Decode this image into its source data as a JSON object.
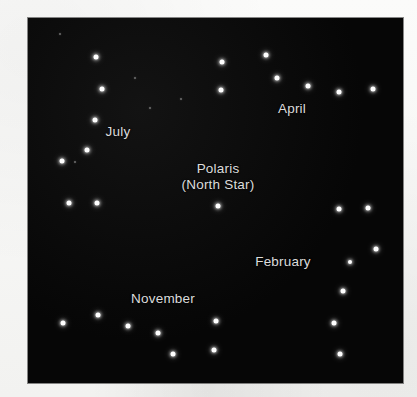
{
  "figure": {
    "kind": "star-chart",
    "background_color": "#f7f7f5",
    "sky_color": "#070707",
    "star_color": "#ffffff",
    "label_color": "#dcdcdc",
    "panel": {
      "x": 28,
      "y": 18,
      "width": 375,
      "height": 365
    }
  },
  "labels": [
    {
      "id": "july",
      "text": "July",
      "x": 118,
      "y": 132
    },
    {
      "id": "april",
      "text": "April",
      "x": 292,
      "y": 109
    },
    {
      "id": "february",
      "text": "February",
      "x": 283,
      "y": 262
    },
    {
      "id": "november",
      "text": "November",
      "x": 163,
      "y": 299
    }
  ],
  "polaris": {
    "line1": "Polaris",
    "line2": "(North Star)",
    "x": 218,
    "y": 177,
    "star": {
      "x": 218,
      "y": 206,
      "size": 5
    }
  },
  "stars": [
    {
      "group": "july",
      "x": 96,
      "y": 57,
      "size": 5
    },
    {
      "group": "july",
      "x": 102,
      "y": 89,
      "size": 5
    },
    {
      "group": "july",
      "x": 95,
      "y": 120,
      "size": 5
    },
    {
      "group": "july",
      "x": 87,
      "y": 150,
      "size": 5
    },
    {
      "group": "july",
      "x": 62,
      "y": 161,
      "size": 5
    },
    {
      "group": "july",
      "x": 69,
      "y": 203,
      "size": 5
    },
    {
      "group": "july",
      "x": 97,
      "y": 203,
      "size": 5
    },
    {
      "group": "april",
      "x": 222,
      "y": 62,
      "size": 5
    },
    {
      "group": "april",
      "x": 266,
      "y": 55,
      "size": 5
    },
    {
      "group": "april",
      "x": 277,
      "y": 78,
      "size": 5
    },
    {
      "group": "april",
      "x": 221,
      "y": 90,
      "size": 5
    },
    {
      "group": "april",
      "x": 308,
      "y": 86,
      "size": 5
    },
    {
      "group": "april",
      "x": 339,
      "y": 92,
      "size": 5
    },
    {
      "group": "april",
      "x": 373,
      "y": 89,
      "size": 5
    },
    {
      "group": "february",
      "x": 339,
      "y": 209,
      "size": 5
    },
    {
      "group": "february",
      "x": 368,
      "y": 208,
      "size": 5
    },
    {
      "group": "february",
      "x": 376,
      "y": 249,
      "size": 5
    },
    {
      "group": "february",
      "x": 350,
      "y": 262,
      "size": 4
    },
    {
      "group": "february",
      "x": 343,
      "y": 291,
      "size": 5
    },
    {
      "group": "february",
      "x": 334,
      "y": 323,
      "size": 5
    },
    {
      "group": "february",
      "x": 340,
      "y": 354,
      "size": 5
    },
    {
      "group": "november",
      "x": 63,
      "y": 323,
      "size": 5
    },
    {
      "group": "november",
      "x": 98,
      "y": 315,
      "size": 5
    },
    {
      "group": "november",
      "x": 128,
      "y": 326,
      "size": 5
    },
    {
      "group": "november",
      "x": 158,
      "y": 333,
      "size": 5
    },
    {
      "group": "november",
      "x": 173,
      "y": 354,
      "size": 5
    },
    {
      "group": "november",
      "x": 216,
      "y": 321,
      "size": 5
    },
    {
      "group": "november",
      "x": 214,
      "y": 350,
      "size": 5
    }
  ],
  "faint_stars": [
    {
      "x": 60,
      "y": 34,
      "size": 2
    },
    {
      "x": 135,
      "y": 78,
      "size": 2
    },
    {
      "x": 150,
      "y": 108,
      "size": 2
    },
    {
      "x": 75,
      "y": 162,
      "size": 2
    },
    {
      "x": 181,
      "y": 99,
      "size": 2
    }
  ]
}
